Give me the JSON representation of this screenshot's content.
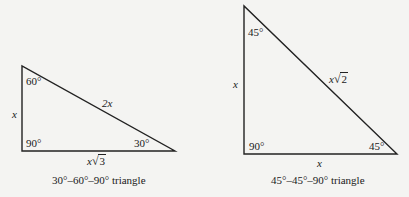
{
  "triangles": [
    {
      "name": "30-60-90",
      "caption": "30°–60°–90° triangle",
      "angles": {
        "top": "60°",
        "right_angle": "90°",
        "acute_bottom": "30°"
      },
      "sides": {
        "vertical_leg": "x",
        "hypotenuse": "2x",
        "horizontal_leg_var": "x",
        "horizontal_leg_radicand": "3"
      },
      "vertices": [
        [
          22,
          66
        ],
        [
          22,
          151
        ],
        [
          175,
          151
        ]
      ]
    },
    {
      "name": "45-45-90",
      "caption": "45°–45°–90° triangle",
      "angles": {
        "top": "45°",
        "right_angle": "90°",
        "acute_bottom": "45°"
      },
      "sides": {
        "vertical_leg": "x",
        "hypotenuse_var": "x",
        "hypotenuse_radicand": "2",
        "horizontal_leg": "x"
      },
      "vertices": [
        [
          244,
          6
        ],
        [
          244,
          154
        ],
        [
          397,
          154
        ]
      ]
    }
  ],
  "symbols": {
    "radical": "√"
  }
}
